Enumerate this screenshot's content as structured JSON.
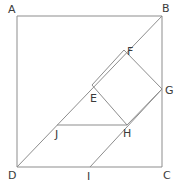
{
  "figure": {
    "canvas": {
      "width": 179,
      "height": 188
    },
    "style": {
      "stroke_color": "#8d8d8d",
      "label_color": "#3b3b3b",
      "background": "#ffffff",
      "stroke_width": 1,
      "label_font_size": 11
    },
    "points": {
      "A": {
        "x": 17,
        "y": 16,
        "label": "A",
        "label_x": 8,
        "label_y": 4
      },
      "B": {
        "x": 162,
        "y": 16,
        "label": "B",
        "label_x": 162,
        "label_y": 3
      },
      "C": {
        "x": 162,
        "y": 167,
        "label": "C",
        "label_x": 163,
        "label_y": 170
      },
      "D": {
        "x": 17,
        "y": 167,
        "label": "D",
        "label_x": 8,
        "label_y": 170
      },
      "E": {
        "x": 92,
        "y": 85,
        "label": "E",
        "label_x": 90,
        "label_y": 93
      },
      "F": {
        "x": 124,
        "y": 50,
        "label": "F",
        "label_x": 127,
        "label_y": 46
      },
      "G": {
        "x": 162,
        "y": 89,
        "label": "G",
        "label_x": 165,
        "label_y": 85
      },
      "H": {
        "x": 127,
        "y": 125,
        "label": "H",
        "label_x": 123,
        "label_y": 128
      },
      "I": {
        "x": 90,
        "y": 167,
        "label": "I",
        "label_x": 87,
        "label_y": 171
      },
      "J": {
        "x": 57,
        "y": 125,
        "label": "J",
        "label_x": 55,
        "label_y": 129
      }
    },
    "segments": [
      {
        "name": "side-AB",
        "from": "A",
        "to": "B"
      },
      {
        "name": "side-BC",
        "from": "B",
        "to": "C"
      },
      {
        "name": "side-CD",
        "from": "C",
        "to": "D"
      },
      {
        "name": "side-DA",
        "from": "D",
        "to": "A"
      },
      {
        "name": "diagonal-DB",
        "from": "D",
        "to": "B"
      },
      {
        "name": "inner-square-side-EF",
        "from": "E",
        "to": "F"
      },
      {
        "name": "inner-square-side-FG",
        "from": "F",
        "to": "G"
      },
      {
        "name": "inner-square-side-GH",
        "from": "G",
        "to": "H"
      },
      {
        "name": "inner-square-side-HE",
        "from": "H",
        "to": "E"
      },
      {
        "name": "segment-IG-through-H",
        "from": "I",
        "to": "G"
      },
      {
        "name": "segment-JH",
        "from": "J",
        "to": "H"
      }
    ]
  }
}
